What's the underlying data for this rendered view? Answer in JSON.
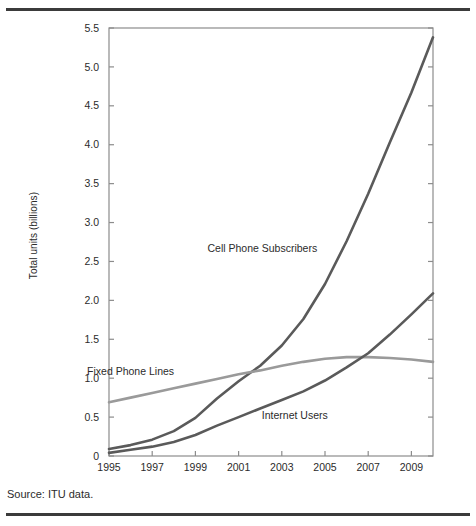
{
  "figure": {
    "source_note": "Source: ITU data."
  },
  "chart_data": {
    "type": "line",
    "title": "",
    "xlabel": "",
    "ylabel": "Total units (billions)",
    "xlim": [
      1995,
      2010
    ],
    "ylim": [
      0,
      5.5
    ],
    "grid": false,
    "legend_position": "inline-annotations",
    "x": [
      1995,
      1996,
      1997,
      1998,
      1999,
      2000,
      2001,
      2002,
      2003,
      2004,
      2005,
      2006,
      2007,
      2008,
      2009,
      2010
    ],
    "x_tick_labels": [
      "1995",
      "1997",
      "1999",
      "2001",
      "2003",
      "2005",
      "2007",
      "2009"
    ],
    "x_tick_values": [
      1995,
      1997,
      1999,
      2001,
      2003,
      2005,
      2007,
      2009
    ],
    "y_tick_labels": [
      "0",
      "0.5",
      "1.0",
      "1.5",
      "2.0",
      "2.5",
      "3.0",
      "3.5",
      "4.0",
      "4.5",
      "5.0",
      "5.5"
    ],
    "y_tick_values": [
      0,
      0.5,
      1.0,
      1.5,
      2.0,
      2.5,
      3.0,
      3.5,
      4.0,
      4.5,
      5.0,
      5.5
    ],
    "series": [
      {
        "name": "Cell Phone Subscribers",
        "color": "#5a5a5a",
        "label_x": 2002.1,
        "label_y": 2.62,
        "values": [
          0.09,
          0.14,
          0.21,
          0.32,
          0.49,
          0.74,
          0.96,
          1.16,
          1.42,
          1.76,
          2.21,
          2.76,
          3.37,
          4.03,
          4.67,
          5.38
        ]
      },
      {
        "name": "Fixed Phone Lines",
        "color": "#9a9a9a",
        "label_x": 1996.0,
        "label_y": 1.04,
        "values": [
          0.69,
          0.75,
          0.81,
          0.87,
          0.93,
          0.99,
          1.05,
          1.1,
          1.16,
          1.21,
          1.25,
          1.27,
          1.27,
          1.26,
          1.24,
          1.21
        ]
      },
      {
        "name": "Internet Users",
        "color": "#5a5a5a",
        "label_x": 2003.6,
        "label_y": 0.47,
        "values": [
          0.04,
          0.08,
          0.12,
          0.18,
          0.27,
          0.39,
          0.5,
          0.61,
          0.72,
          0.83,
          0.97,
          1.14,
          1.32,
          1.56,
          1.82,
          2.09
        ]
      }
    ]
  }
}
